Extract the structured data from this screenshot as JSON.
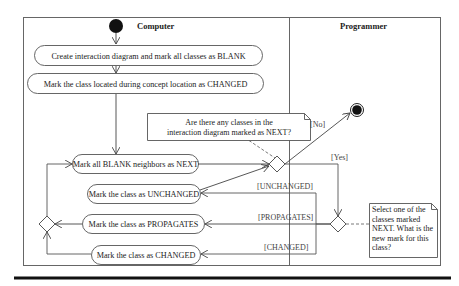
{
  "diagram": {
    "type": "UML activity diagram with swimlanes",
    "swimlanes": [
      {
        "label": "Computer"
      },
      {
        "label": "Programmer"
      }
    ],
    "actions": [
      {
        "id": "create",
        "label": "Create interaction diagram and mark all classes as BLANK"
      },
      {
        "id": "mark_changed_initial",
        "label": "Mark the class located during concept location as CHANGED"
      },
      {
        "id": "mark_neighbors",
        "label": "Mark all BLANK neighbors as NEXT"
      },
      {
        "id": "mark_unchanged",
        "label": "Mark the class as UNCHANGED"
      },
      {
        "id": "mark_propagates",
        "label": "Mark the class as PROPAGATES"
      },
      {
        "id": "mark_changed",
        "label": "Mark the class as CHANGED"
      }
    ],
    "notes": [
      {
        "id": "note_next",
        "lines": [
          "Are there any classes in the",
          "interaction diagram marked as NEXT?"
        ]
      },
      {
        "id": "note_select",
        "lines": [
          "Select one of the",
          "classes marked",
          "NEXT. What is the",
          "new mark for this",
          "class?"
        ]
      }
    ],
    "guards": {
      "no": "[No]",
      "yes": "[Yes]",
      "unchanged": "[UNCHANGED]",
      "propagates": "[PROPAGATES]",
      "changed": "[CHANGED]"
    },
    "colors": {
      "line": "#555555",
      "node_fill": "#111111",
      "rule": "#111111"
    }
  }
}
